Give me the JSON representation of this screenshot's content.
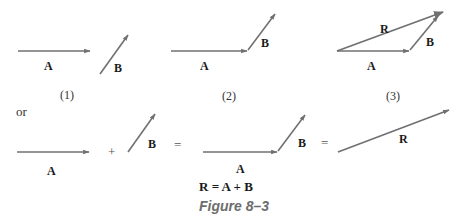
{
  "figure": {
    "caption": "Figure 8–3",
    "equation": "R = A + B",
    "connector_word": "or",
    "colors": {
      "arrow": "#707070",
      "label": "#1a1a1a",
      "caption": "#6d6d6d"
    }
  },
  "panels": [
    {
      "id": "1",
      "sublabel": "(1)",
      "vectors": [
        {
          "name": "A",
          "label": "A"
        },
        {
          "name": "B",
          "label": "B"
        }
      ]
    },
    {
      "id": "2",
      "sublabel": "(2)",
      "vectors": [
        {
          "name": "A",
          "label": "A"
        },
        {
          "name": "B",
          "label": "B"
        }
      ]
    },
    {
      "id": "3",
      "sublabel": "(3)",
      "vectors": [
        {
          "name": "A",
          "label": "A"
        },
        {
          "name": "B",
          "label": "B"
        },
        {
          "name": "R",
          "label": "R"
        }
      ]
    }
  ],
  "bottom_row": {
    "term1_label": "A",
    "plus": "+",
    "term2_label": "B",
    "equals1": "=",
    "sum_labels": {
      "A": "A",
      "B": "B"
    },
    "equals2": "=",
    "result_label": "R"
  }
}
